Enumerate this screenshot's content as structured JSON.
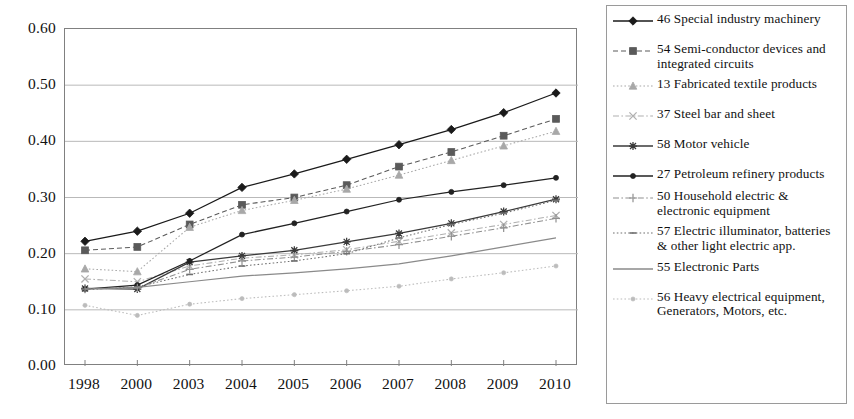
{
  "chart_data": {
    "type": "line",
    "title": "",
    "xlabel": "",
    "ylabel": "",
    "x": [
      "1998",
      "2000",
      "2003",
      "2004",
      "2005",
      "2006",
      "2007",
      "2008",
      "2009",
      "2010"
    ],
    "categories": [
      "1998",
      "2000",
      "2003",
      "2004",
      "2005",
      "2006",
      "2007",
      "2008",
      "2009",
      "2010"
    ],
    "ylim": [
      0.0,
      0.6
    ],
    "yticks": [
      "0.00",
      "0.10",
      "0.20",
      "0.30",
      "0.40",
      "0.50",
      "0.60"
    ],
    "ytick_values": [
      0.0,
      0.1,
      0.2,
      0.3,
      0.4,
      0.5,
      0.6
    ],
    "grid": true,
    "legend_position": "right",
    "series": [
      {
        "name": "46 Special industry machinery",
        "code": "46",
        "marker": "filled-diamond",
        "color": "#1a1a1a",
        "dash": "solid",
        "values": [
          0.222,
          0.24,
          0.272,
          0.318,
          0.342,
          0.368,
          0.394,
          0.421,
          0.451,
          0.486
        ]
      },
      {
        "name": "54 Semi-conductor devices and integrated circuits",
        "code": "54",
        "marker": "filled-square",
        "color": "#5a5a5a",
        "dash": "dashed",
        "values": [
          0.206,
          0.212,
          0.252,
          0.287,
          0.3,
          0.322,
          0.355,
          0.381,
          0.41,
          0.44
        ]
      },
      {
        "name": "13 Fabricated textile products",
        "code": "13",
        "marker": "triangle",
        "color": "#a8a8a8",
        "dash": "dotted",
        "values": [
          0.173,
          0.168,
          0.247,
          0.277,
          0.295,
          0.315,
          0.34,
          0.366,
          0.392,
          0.418
        ]
      },
      {
        "name": "37 Steel bar and sheet",
        "code": "37",
        "marker": "cross-x",
        "color": "#b0b0b0",
        "dash": "dash-dot",
        "values": [
          0.155,
          0.15,
          0.178,
          0.192,
          0.198,
          0.207,
          0.222,
          0.237,
          0.252,
          0.268
        ]
      },
      {
        "name": "58 Motor vehicle",
        "code": "58",
        "marker": "asterisk",
        "color": "#3a3a3a",
        "dash": "solid",
        "values": [
          0.138,
          0.137,
          0.185,
          0.196,
          0.206,
          0.221,
          0.236,
          0.254,
          0.275,
          0.297
        ]
      },
      {
        "name": "27 Petroleum refinery products",
        "code": "27",
        "marker": "small-circle",
        "color": "#222222",
        "dash": "solid",
        "values": [
          0.137,
          0.144,
          0.187,
          0.234,
          0.254,
          0.275,
          0.296,
          0.31,
          0.322,
          0.335
        ]
      },
      {
        "name": "50 Household electric & electronic equipment",
        "code": "50",
        "marker": "plus-bar",
        "color": "#909090",
        "dash": "dash-dot",
        "values": [
          0.137,
          0.139,
          0.172,
          0.187,
          0.194,
          0.204,
          0.216,
          0.231,
          0.246,
          0.263
        ]
      },
      {
        "name": "57 Electric illuminator, batteries & other light electric app.",
        "code": "57",
        "marker": "short-dash",
        "color": "#707070",
        "dash": "dotted",
        "values": [
          0.136,
          0.141,
          0.163,
          0.178,
          0.187,
          0.2,
          0.228,
          0.252,
          0.272,
          0.295
        ]
      },
      {
        "name": "55 Electronic Parts",
        "code": "55",
        "marker": "none",
        "color": "#8a8a8a",
        "dash": "solid",
        "values": [
          0.137,
          0.14,
          0.15,
          0.16,
          0.166,
          0.173,
          0.182,
          0.196,
          0.212,
          0.228
        ]
      },
      {
        "name": "56 Heavy electrical equipment, Generators, Motors, etc.",
        "code": "56",
        "marker": "small-dot",
        "color": "#bcbcbc",
        "dash": "dotted",
        "values": [
          0.108,
          0.09,
          0.11,
          0.12,
          0.127,
          0.134,
          0.142,
          0.155,
          0.166,
          0.178
        ]
      }
    ]
  },
  "axes": {
    "y_ticks": [
      "0.60",
      "0.50",
      "0.40",
      "0.30",
      "0.20",
      "0.10",
      "0.00"
    ],
    "x_ticks": [
      "1998",
      "2000",
      "2003",
      "2004",
      "2005",
      "2006",
      "2007",
      "2008",
      "2009",
      "2010"
    ]
  },
  "legend": {
    "items": [
      {
        "label": "46 Special industry machinery"
      },
      {
        "label": "54 Semi-conductor devices and integrated circuits"
      },
      {
        "label": "13 Fabricated textile products"
      },
      {
        "label": "37 Steel bar and sheet"
      },
      {
        "label": "58 Motor vehicle"
      },
      {
        "label": "27 Petroleum refinery products"
      },
      {
        "label": "50 Household electric & electronic equipment"
      },
      {
        "label": "57 Electric illuminator, batteries & other light electric app."
      },
      {
        "label": "55 Electronic Parts"
      },
      {
        "label": "56 Heavy electrical equipment, Generators, Motors, etc."
      }
    ]
  },
  "colors": {
    "gridline": "#b9b9b9",
    "axis": "#808080",
    "legend_border": "#9a9a9a",
    "text": "#111111"
  }
}
